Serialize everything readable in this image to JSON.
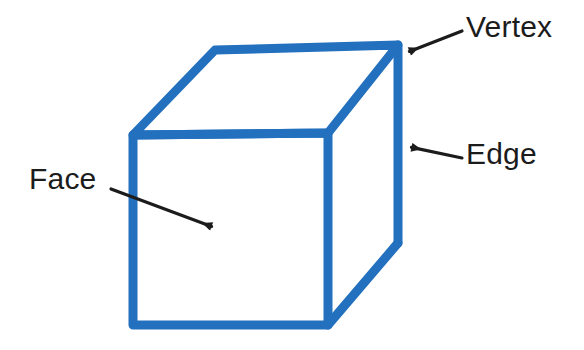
{
  "figure": {
    "background_color": "#ffffff",
    "cube_stroke_color": "#2270be",
    "cube_stroke_width": 9,
    "cube_fill_color": "#ffffff",
    "annotation_color": "#1c1c1c"
  },
  "labels": {
    "vertex": "Vertex",
    "edge": "Edge",
    "face": "Face"
  },
  "chart_data": {
    "type": "diagram",
    "shape": "cube",
    "projection": "oblique",
    "stroke_color": "#2270be",
    "stroke_width": 9,
    "vertices": {
      "front_top_left": [
        133,
        135
      ],
      "front_top_right": [
        328,
        133
      ],
      "front_bottom_right": [
        328,
        325
      ],
      "front_bottom_left": [
        133,
        325
      ],
      "back_top_left": [
        215,
        50
      ],
      "back_top_right": [
        398,
        45
      ],
      "back_bottom_right": [
        398,
        243
      ]
    },
    "faces": [
      {
        "name": "front-face",
        "points": [
          [
            133,
            135
          ],
          [
            328,
            133
          ],
          [
            328,
            325
          ],
          [
            133,
            325
          ]
        ],
        "visible": true
      },
      {
        "name": "top-face",
        "points": [
          [
            133,
            135
          ],
          [
            215,
            50
          ],
          [
            398,
            45
          ],
          [
            328,
            133
          ]
        ],
        "visible": true
      },
      {
        "name": "right-face",
        "points": [
          [
            328,
            133
          ],
          [
            398,
            45
          ],
          [
            398,
            243
          ],
          [
            328,
            325
          ]
        ],
        "visible": true
      }
    ],
    "annotations": [
      {
        "label": "Vertex",
        "label_position": [
          466,
          12
        ],
        "arrow_start": [
          462,
          31
        ],
        "arrow_tip": [
          408,
          52
        ],
        "points_to": "back_top_right vertex"
      },
      {
        "label": "Edge",
        "label_position": [
          466,
          139
        ],
        "arrow_start": [
          462,
          158
        ],
        "arrow_tip": [
          410,
          147
        ],
        "points_to": "right vertical edge"
      },
      {
        "label": "Face",
        "label_position": [
          29,
          164
        ],
        "arrow_start": [
          111,
          189
        ],
        "arrow_tip": [
          213,
          227
        ],
        "points_to": "front face interior"
      }
    ]
  }
}
